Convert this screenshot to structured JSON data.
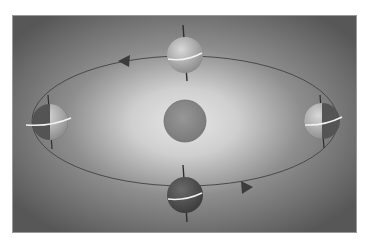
{
  "figure": {
    "colors": {
      "background_dark": "#5e5e5e",
      "glow_center": "#e2e2e2",
      "sun": "#8a8a8a",
      "orbit_line": "#4a4a4a",
      "equator_line": "#f2f2f2",
      "axis_line": "#2e2e2e",
      "earth_lit": "#c4c4c4",
      "earth_dark": "#555555",
      "arrow": "#3c3c3c"
    },
    "sun": {
      "cx": 173,
      "cy": 106,
      "r": 21
    },
    "orbit": {
      "cx": 173,
      "cy": 106,
      "rx": 153,
      "ry": 65
    },
    "earths": [
      {
        "name": "top",
        "cx": 173,
        "cy": 40,
        "r": 18,
        "phase": "mostly-lit"
      },
      {
        "name": "bottom",
        "cx": 173,
        "cy": 180,
        "r": 18,
        "phase": "mostly-dark"
      },
      {
        "name": "left",
        "cx": 38,
        "cy": 107,
        "r": 18,
        "phase": "half-lit-right"
      },
      {
        "name": "right",
        "cx": 310,
        "cy": 106,
        "r": 18,
        "phase": "half-lit-left"
      }
    ],
    "arrows": [
      {
        "name": "orbit-direction-top-left",
        "x": 111,
        "y": 46,
        "direction": "left"
      },
      {
        "name": "orbit-direction-bottom-right",
        "x": 236,
        "y": 172,
        "direction": "right"
      }
    ]
  }
}
